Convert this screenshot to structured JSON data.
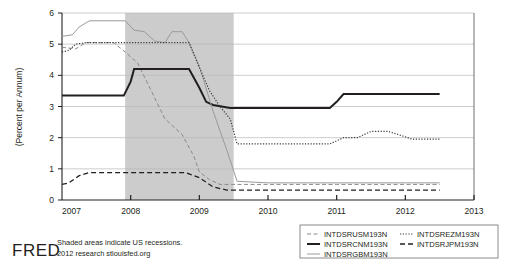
{
  "footer": {
    "logo": "FRED",
    "note_line1": "Shaded areas indicate US recessions.",
    "note_line2": "2012 research stlouisfed.org"
  },
  "legend": {
    "items": [
      {
        "label": "INTDSRUSM193N",
        "style": "dashed",
        "color": "#8a8a8a",
        "width": 1.0
      },
      {
        "label": "INTDSRCNM193N",
        "style": "solid",
        "color": "#231f20",
        "width": 2.0
      },
      {
        "label": "INTDSRGBM193N",
        "style": "solid",
        "color": "#9a9a9a",
        "width": 1.0
      },
      {
        "label": "INTDSREZM193N",
        "style": "dotted",
        "color": "#3a3a3a",
        "width": 1.2
      },
      {
        "label": "INTDSRJPM193N",
        "style": "longdashed",
        "color": "#231f20",
        "width": 1.3
      }
    ]
  },
  "chart_data": {
    "type": "line",
    "title": "",
    "xlabel": "",
    "ylabel": "(Percent per Annum)",
    "xlim": [
      2007.0,
      2013.0
    ],
    "ylim": [
      0,
      6
    ],
    "yticks": [
      0,
      1,
      2,
      3,
      4,
      5,
      6
    ],
    "xticks": [
      2007,
      2008,
      2009,
      2010,
      2011,
      2012,
      2013
    ],
    "xtick_labels": [
      "2007",
      "2008",
      "2009",
      "2010",
      "2011",
      "2012",
      "2013"
    ],
    "grid": true,
    "legend_position": "bottom-right",
    "shaded_regions": [
      {
        "label": "US recession",
        "x_start": 2007.92,
        "x_end": 2009.5,
        "color": "#cccccc"
      }
    ],
    "series": [
      {
        "name": "INTDSRUSM193N",
        "style": "dashed",
        "color": "#8a8a8a",
        "x": [
          2007.0,
          2007.2,
          2007.35,
          2007.5,
          2007.75,
          2007.92,
          2008.1,
          2008.3,
          2008.5,
          2008.75,
          2008.92,
          2009.0,
          2009.15,
          2009.3,
          2009.5,
          2010.0,
          2011.0,
          2012.0,
          2012.5
        ],
        "y": [
          4.9,
          4.85,
          5.05,
          5.05,
          5.05,
          4.75,
          4.4,
          3.5,
          2.6,
          2.1,
          1.4,
          0.9,
          0.65,
          0.5,
          0.5,
          0.5,
          0.5,
          0.5,
          0.5
        ]
      },
      {
        "name": "INTDSRCNM193N",
        "style": "solid",
        "color": "#231f20",
        "x": [
          2007.0,
          2007.9,
          2008.0,
          2008.05,
          2008.85,
          2009.0,
          2009.1,
          2009.2,
          2009.45,
          2010.0,
          2010.9,
          2011.0,
          2011.1,
          2012.0,
          2012.5
        ],
        "y": [
          3.35,
          3.35,
          3.8,
          4.2,
          4.2,
          3.6,
          3.15,
          3.05,
          2.95,
          2.95,
          2.95,
          3.15,
          3.4,
          3.4,
          3.4
        ]
      },
      {
        "name": "INTDSRGBM193N",
        "style": "solid",
        "color": "#9a9a9a",
        "x": [
          2007.0,
          2007.15,
          2007.25,
          2007.4,
          2007.55,
          2007.92,
          2008.05,
          2008.2,
          2008.35,
          2008.5,
          2008.6,
          2008.75,
          2008.85,
          2009.0,
          2009.2,
          2009.4,
          2009.55,
          2010.0,
          2011.0,
          2012.0,
          2012.5
        ],
        "y": [
          5.25,
          5.3,
          5.55,
          5.75,
          5.75,
          5.75,
          5.45,
          5.4,
          5.1,
          5.05,
          5.4,
          5.4,
          5.05,
          4.3,
          2.85,
          1.6,
          0.6,
          0.55,
          0.55,
          0.55,
          0.55
        ]
      },
      {
        "name": "INTDSREZM193N",
        "style": "dotted",
        "color": "#3a3a3a",
        "x": [
          2007.0,
          2007.1,
          2007.2,
          2007.35,
          2007.5,
          2007.92,
          2008.5,
          2008.85,
          2009.0,
          2009.15,
          2009.3,
          2009.45,
          2009.55,
          2010.0,
          2010.75,
          2010.9,
          2011.1,
          2011.3,
          2011.5,
          2011.75,
          2011.9,
          2012.1,
          2012.5
        ],
        "y": [
          4.75,
          4.8,
          5.0,
          5.05,
          5.05,
          5.05,
          5.05,
          5.05,
          4.25,
          3.5,
          3.0,
          2.6,
          1.8,
          1.8,
          1.8,
          1.8,
          2.0,
          2.0,
          2.2,
          2.2,
          2.1,
          1.95,
          1.95
        ]
      },
      {
        "name": "INTDSRJPM193N",
        "style": "longdashed",
        "color": "#231f20",
        "x": [
          2007.0,
          2007.1,
          2007.25,
          2007.4,
          2008.8,
          2009.0,
          2009.2,
          2009.4,
          2010.0,
          2011.0,
          2012.0,
          2012.5
        ],
        "y": [
          0.5,
          0.55,
          0.78,
          0.88,
          0.88,
          0.72,
          0.42,
          0.32,
          0.32,
          0.32,
          0.32,
          0.32
        ]
      }
    ]
  }
}
